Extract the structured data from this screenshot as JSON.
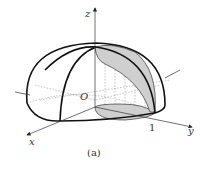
{
  "figure": {
    "caption": "(a)",
    "axes": {
      "x_label": "x",
      "y_label": "y",
      "z_label": "z"
    },
    "origin_label": "O",
    "tick_y_label": "1",
    "colors": {
      "stroke": "#111111",
      "shade": "#cfcfcf",
      "background": "#ffffff"
    }
  }
}
